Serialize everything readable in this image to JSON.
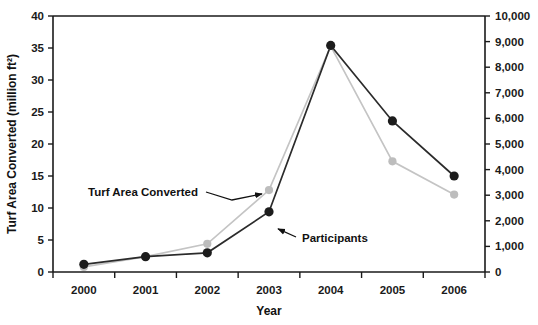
{
  "chart_data": {
    "type": "line",
    "title": "",
    "xlabel": "Year",
    "ylabel": "Turf Area Converted (million ft²)",
    "ylabel_right": "",
    "categories": [
      "2000",
      "2001",
      "2002",
      "2003",
      "2004",
      "2005",
      "2006"
    ],
    "x": [
      2000,
      2001,
      2002,
      2003,
      2004,
      2005,
      2006
    ],
    "ylim": [
      0,
      40
    ],
    "ylim_right": [
      0,
      10000
    ],
    "ytick_labels": [
      "0",
      "5",
      "10",
      "15",
      "20",
      "25",
      "30",
      "35",
      "40"
    ],
    "ytick_values": [
      0,
      5,
      10,
      15,
      20,
      25,
      30,
      35,
      40
    ],
    "ytick_labels_right": [
      "0",
      "1,000",
      "2,000",
      "3,000",
      "4,000",
      "5,000",
      "6,000",
      "7,000",
      "8,000",
      "9,000",
      "10,000"
    ],
    "ytick_values_right": [
      0,
      1000,
      2000,
      3000,
      4000,
      5000,
      6000,
      7000,
      8000,
      9000,
      10000
    ],
    "grid": false,
    "legend_position": "inline-annotations",
    "series": [
      {
        "name": "Turf Area Converted",
        "axis": "left",
        "color": "#bdbdbd",
        "values": [
          0.8,
          2.4,
          4.4,
          12.8,
          35.3,
          17.3,
          12.1
        ]
      },
      {
        "name": "Participants",
        "axis": "right",
        "color": "#1c1c1c",
        "values": [
          300,
          600,
          750,
          2350,
          8850,
          5900,
          3750
        ]
      }
    ],
    "annotations": [
      {
        "text": "Turf Area Converted",
        "target_x": 2003.0,
        "target_y_left": 13.0
      },
      {
        "text": "Participants",
        "target_x": 2003.0,
        "target_y_left": 9.4
      }
    ]
  }
}
